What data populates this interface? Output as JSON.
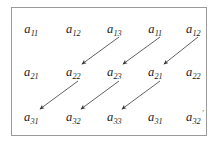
{
  "figure": {
    "type": "matrix-diagram",
    "frame": {
      "border_color": "#9a9a9a",
      "background_color": "#ffffff"
    },
    "text_color": "#1a1a1a",
    "arrow_color": "#3a3a3a",
    "rows": [
      {
        "row_index": 1,
        "cells": [
          {
            "base": "a",
            "sub": "11"
          },
          {
            "base": "a",
            "sub": "12"
          },
          {
            "base": "a",
            "sub": "13"
          },
          {
            "base": "a",
            "sub": "11"
          },
          {
            "base": "a",
            "sub": "12"
          }
        ]
      },
      {
        "row_index": 2,
        "cells": [
          {
            "base": "a",
            "sub": "21"
          },
          {
            "base": "a",
            "sub": "22"
          },
          {
            "base": "a",
            "sub": "23"
          },
          {
            "base": "a",
            "sub": "21"
          },
          {
            "base": "a",
            "sub": "22"
          }
        ]
      },
      {
        "row_index": 3,
        "cells": [
          {
            "base": "a",
            "sub": "31"
          },
          {
            "base": "a",
            "sub": "32"
          },
          {
            "base": "a",
            "sub": "33"
          },
          {
            "base": "a",
            "sub": "31"
          },
          {
            "base": "a",
            "sub": "32"
          }
        ]
      }
    ],
    "arrows": [
      {
        "from": "a13",
        "to": "a22",
        "direction": "down-left"
      },
      {
        "from": "a11",
        "to": "a23",
        "direction": "down-left"
      },
      {
        "from": "a12",
        "to": "a21",
        "direction": "down-left"
      },
      {
        "from": "a22",
        "to": "a31",
        "direction": "down-left"
      },
      {
        "from": "a23",
        "to": "a32",
        "direction": "down-left"
      },
      {
        "from": "a21",
        "to": "a33",
        "direction": "down-left"
      }
    ],
    "corner_mark": ","
  }
}
